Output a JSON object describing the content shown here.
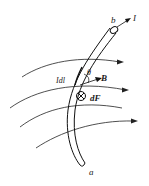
{
  "figure": {
    "labels": {
      "end_b": "b",
      "current": "I",
      "end_a": "a",
      "current_element": "Idl",
      "angle": "θ",
      "field": "B",
      "force": "dF"
    },
    "force_direction_symbol": "into-page",
    "field_lines_count": 4
  }
}
